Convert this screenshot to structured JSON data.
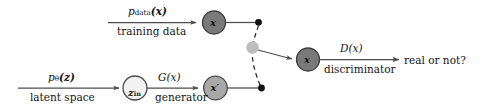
{
  "diagram": {
    "background_color": "#ffffff",
    "stroke_color": "#4d4d4d",
    "text_color": "#141414",
    "colors": {
      "dark_node_fill": "#7a7a7a",
      "dark_node_stroke": "#3d3d3d",
      "mid_node_fill": "#a8a8a8",
      "mid_node_stroke": "#4a4a4a",
      "light_node_fill": "#f2f2f2",
      "light_node_stroke": "#4a4a4a",
      "junction_fill": "#bdbdbd",
      "dot_fill": "#111111",
      "dashed_stroke": "#2b2b2b"
    },
    "branches": {
      "real": {
        "source_top_label": "p",
        "source_top_sub": "data",
        "source_top_arg": "(x)",
        "source_bottom_label": "training data",
        "node_label": "x"
      },
      "fake": {
        "source_top_label": "p",
        "source_top_sub": "θ",
        "source_top_arg": "(z)",
        "source_bottom_label": "latent space",
        "latent_node_label": "z",
        "latent_node_sub": "in",
        "transform_top_label": "G(x)",
        "transform_bottom_label": "generator",
        "node_label": "x′"
      }
    },
    "discriminator": {
      "node_label": "x",
      "top_label": "D(x)",
      "bottom_label": "discriminator",
      "output_label": "real or not?"
    }
  }
}
